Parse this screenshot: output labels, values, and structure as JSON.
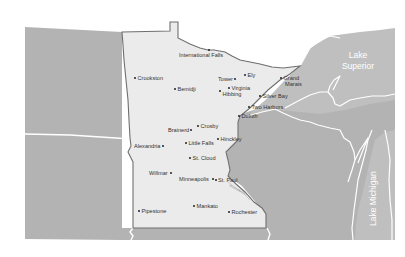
{
  "map": {
    "region": "Minnesota",
    "lakes": [
      {
        "id": "lake-superior",
        "lines": [
          "Lake",
          "Superior"
        ]
      },
      {
        "id": "lake-michigan",
        "lines": [
          "Lake Michigan"
        ]
      }
    ],
    "river": {
      "label": "Mississippi River"
    },
    "cities": [
      {
        "name": "International Falls",
        "x": 209,
        "y": 50,
        "label_x": 179,
        "label_y": 56.5
      },
      {
        "name": "Crookston",
        "x": 135,
        "y": 78,
        "label_x": 137.5,
        "label_y": 80
      },
      {
        "name": "Bemidji",
        "x": 175,
        "y": 89,
        "label_x": 177.5,
        "label_y": 91
      },
      {
        "name": "Tower",
        "x": 235,
        "y": 79,
        "label_x": 218,
        "label_y": 81
      },
      {
        "name": "Ely",
        "x": 245,
        "y": 75,
        "label_x": 247.5,
        "label_y": 77
      },
      {
        "name": "Grand Marais",
        "x": 281,
        "y": 78,
        "label_x": 283.5,
        "label_y": 80,
        "label_line2": "Marais",
        "label2_x": 285,
        "label2_y": 85.5
      },
      {
        "name": "Virginia",
        "x": 229,
        "y": 88,
        "label_x": 231.5,
        "label_y": 90
      },
      {
        "name": "Hibbing",
        "x": 220,
        "y": 91,
        "label_x": 222.5,
        "label_y": 96
      },
      {
        "name": "Silver Bay",
        "x": 260,
        "y": 96,
        "label_x": 262.5,
        "label_y": 98
      },
      {
        "name": "Two Harbors",
        "x": 249,
        "y": 107,
        "label_x": 251.5,
        "label_y": 109
      },
      {
        "name": "Duluth",
        "x": 239,
        "y": 116,
        "label_x": 241.5,
        "label_y": 118
      },
      {
        "name": "Crosby",
        "x": 198,
        "y": 126,
        "label_x": 200.5,
        "label_y": 128
      },
      {
        "name": "Brainerd",
        "x": 191,
        "y": 130,
        "label_x": 168,
        "label_y": 132
      },
      {
        "name": "Little Falls",
        "x": 186,
        "y": 143,
        "label_x": 188.5,
        "label_y": 145
      },
      {
        "name": "Hinckley",
        "x": 218,
        "y": 139,
        "label_x": 220.5,
        "label_y": 141
      },
      {
        "name": "Alexandria",
        "x": 163,
        "y": 146,
        "label_x": 134,
        "label_y": 148
      },
      {
        "name": "St. Cloud",
        "x": 190,
        "y": 158,
        "label_x": 192.5,
        "label_y": 160
      },
      {
        "name": "Willmar",
        "x": 171,
        "y": 173,
        "label_x": 149,
        "label_y": 175
      },
      {
        "name": "Minneapolis",
        "x": 213,
        "y": 179,
        "label_x": 179,
        "label_y": 181
      },
      {
        "name": "St. Paul",
        "x": 216,
        "y": 180,
        "label_x": 218,
        "label_y": 182
      },
      {
        "name": "Pipestone",
        "x": 139,
        "y": 211,
        "label_x": 141.5,
        "label_y": 213
      },
      {
        "name": "Mankato",
        "x": 194,
        "y": 206,
        "label_x": 196.5,
        "label_y": 208
      },
      {
        "name": "Rochester",
        "x": 229,
        "y": 212,
        "label_x": 231.5,
        "label_y": 214
      }
    ]
  },
  "colors": {
    "background": "#ffffff",
    "land": "#b3b3b3",
    "minnesota": "#ebebeb",
    "outline": "#6f6f6f",
    "borders": "#ffffff",
    "text": "#333333"
  }
}
